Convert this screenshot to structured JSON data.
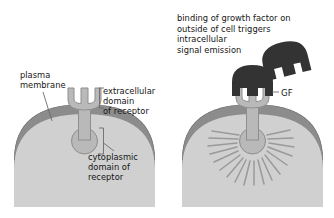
{
  "figure": {
    "background_color": "#ffffff",
    "text_color": "#151515"
  },
  "palette": {
    "cytoplasm": "#d0d0d0",
    "membrane": "#8c8c8c",
    "membrane_edge": "#6f6f6f",
    "receptor_fill": "#b9b9b9",
    "receptor_stroke": "#8e8e8e",
    "growth_factor": "#333333",
    "signal_rays": "#9a9a9a",
    "leader_line": "#6b6b6b"
  },
  "panels": [
    {
      "id": "unbound",
      "name": "receptor-without-growth-factor",
      "state": "unbound",
      "receptor_shape": "cupped extracellular domain with central prong, stalk through membrane, round cytoplasmic domain",
      "signal_emitted": false
    },
    {
      "id": "bound",
      "name": "receptor-with-growth-factor",
      "state": "growth factor bound",
      "receptor_shape": "extracellular prongs interlocked with notched growth factor, stalk through membrane, round cytoplasmic domain emitting rays",
      "signal_emitted": true,
      "signal_ray_count": 22
    }
  ],
  "labels": {
    "plasma_membrane": "plasma\nmembrane",
    "extracellular_domain": "extracellular\ndomain\nof receptor",
    "cytoplasmic_domain": "cytoplasmic\ndomain of\nreceptor",
    "binding_note": "binding of growth factor on\noutside of cell triggers\nintracellular\nsignal emission",
    "growth_factor_abbr": "GF"
  },
  "annotations": {
    "brackets": [
      "extracellular-domain-bracket",
      "cytoplasmic-domain-bracket"
    ],
    "leader_lines": [
      "plasma-membrane-leader",
      "cytoplasmic-domain-leader",
      "gf-leader"
    ]
  }
}
